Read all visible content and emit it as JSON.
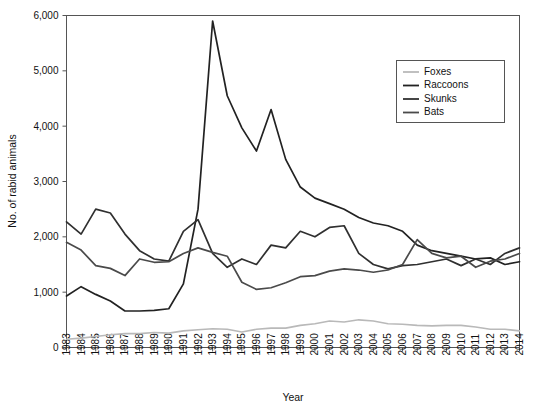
{
  "chart_data": {
    "type": "line",
    "title": "",
    "xlabel": "Year",
    "ylabel": "No. of rabid animals",
    "grid": false,
    "legend_position": "top-right",
    "xlim": [
      1983,
      2014
    ],
    "ylim": [
      0,
      6000
    ],
    "y_ticks": [
      0,
      1000,
      2000,
      3000,
      4000,
      5000,
      6000
    ],
    "y_tick_labels": [
      "0",
      "1,000",
      "2,000",
      "3,000",
      "4,000",
      "5,000",
      "6,000"
    ],
    "x": [
      1983,
      1984,
      1985,
      1986,
      1987,
      1988,
      1989,
      1990,
      1991,
      1992,
      1993,
      1994,
      1995,
      1996,
      1997,
      1998,
      1999,
      2000,
      2001,
      2002,
      2003,
      2004,
      2005,
      2006,
      2007,
      2008,
      2009,
      2010,
      2011,
      2012,
      2013,
      2014
    ],
    "categories": [
      "1983",
      "1984",
      "1985",
      "1986",
      "1987",
      "1988",
      "1989",
      "1990",
      "1991",
      "1992",
      "1993",
      "1994",
      "1995",
      "1996",
      "1997",
      "1998",
      "1999",
      "2000",
      "2001",
      "2002",
      "2003",
      "2004",
      "2005",
      "2006",
      "2007",
      "2008",
      "2009",
      "2010",
      "2011",
      "2012",
      "2013",
      "2014"
    ],
    "series": [
      {
        "name": "Foxes",
        "color": "#b9b9b9",
        "width": 1.6,
        "values": [
          150,
          170,
          200,
          230,
          250,
          250,
          270,
          260,
          300,
          320,
          340,
          330,
          280,
          330,
          350,
          350,
          400,
          430,
          480,
          460,
          500,
          480,
          430,
          420,
          400,
          390,
          400,
          400,
          370,
          330,
          330,
          300
        ]
      },
      {
        "name": "Raccoons",
        "color": "#222222",
        "width": 1.7,
        "values": [
          930,
          1100,
          960,
          840,
          660,
          660,
          670,
          700,
          1150,
          2500,
          5900,
          4550,
          3970,
          3550,
          4300,
          3400,
          2900,
          2700,
          2600,
          2500,
          2350,
          2250,
          2200,
          2100,
          1850,
          1750,
          1700,
          1650,
          1600,
          1620,
          1500,
          1550
        ]
      },
      {
        "name": "Skunks",
        "color": "#303030",
        "width": 1.7,
        "values": [
          2270,
          2050,
          2500,
          2430,
          2050,
          1750,
          1600,
          1560,
          2100,
          2310,
          1700,
          1450,
          1600,
          1500,
          1850,
          1800,
          2100,
          2000,
          2170,
          2200,
          1700,
          1500,
          1420,
          1480,
          1500,
          1550,
          1600,
          1480,
          1600,
          1500,
          1700,
          1800
        ]
      },
      {
        "name": "Bats",
        "color": "#4a4a4a",
        "width": 1.7,
        "values": [
          1900,
          1760,
          1480,
          1430,
          1300,
          1600,
          1540,
          1550,
          1700,
          1800,
          1720,
          1650,
          1180,
          1050,
          1080,
          1170,
          1280,
          1300,
          1380,
          1420,
          1400,
          1360,
          1400,
          1500,
          1950,
          1700,
          1620,
          1650,
          1450,
          1560,
          1600,
          1700
        ]
      }
    ]
  },
  "legend": {
    "entries": [
      {
        "label": "Foxes"
      },
      {
        "label": "Raccoons"
      },
      {
        "label": "Skunks"
      },
      {
        "label": "Bats"
      }
    ]
  },
  "axes": {
    "y_title": "No. of rabid animals",
    "x_title": "Year"
  }
}
